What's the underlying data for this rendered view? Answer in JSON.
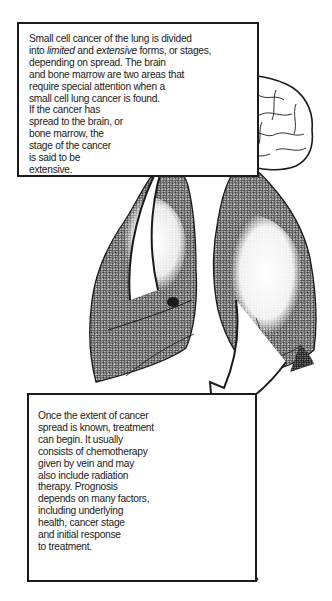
{
  "diagram": {
    "top_callout": {
      "lines": [
        "Small cell cancer of the lung is divided",
        "depending on spread. The brain",
        "and bone marrow are two areas that",
        "require special attention when a",
        "small cell lung cancer is found.",
        "If the cancer has",
        "spread to the brain, or",
        "bone marrow, the",
        "stage of the cancer",
        "is said to be",
        "extensive."
      ],
      "line2": {
        "prefix": "into ",
        "limited": "limited",
        "middle": " and ",
        "extensive": "extensive",
        "suffix": " forms, or stages,"
      }
    },
    "bottom_callout": {
      "lines": [
        "Once the extent of cancer",
        "spread is known, treatment",
        "can begin. It usually",
        "consists of chemotherapy",
        "given by vein and may",
        "also include radiation",
        "therapy. Prognosis",
        "depends on many factors,",
        "including underlying",
        "health, cancer stage",
        "and initial response",
        "to treatment."
      ]
    },
    "illustrations": [
      {
        "name": "brain",
        "position": "top-right"
      },
      {
        "name": "right-lung-with-tumor",
        "position": "center-left"
      },
      {
        "name": "left-lung",
        "position": "center-right"
      },
      {
        "name": "spine",
        "position": "bottom-right"
      },
      {
        "name": "arrow-up-to-brain",
        "from": "lung",
        "to": "brain"
      },
      {
        "name": "arrow-down-to-spine",
        "from": "lung",
        "to": "spine"
      }
    ],
    "colors": {
      "ink": "#1a1a1a",
      "shade": "#6b6b6b",
      "paper": "#ffffff"
    }
  }
}
